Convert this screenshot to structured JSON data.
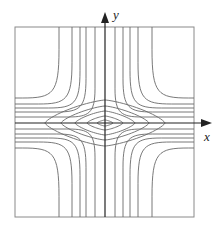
{
  "figure": {
    "axes": {
      "x_label": "x",
      "y_label": "y"
    },
    "colors": {
      "curve": "#6a6a6a",
      "axis": "#222222",
      "frame": "#8a8a8a"
    },
    "contours": {
      "closed_loops": 5,
      "curves_per_quadrant": 5
    }
  }
}
